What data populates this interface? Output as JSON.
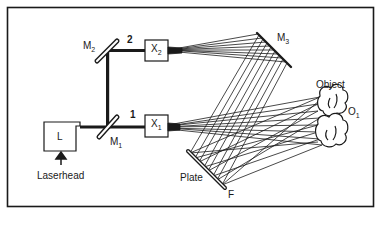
{
  "diagram": {
    "type": "holographic interferometry optical setup",
    "components": {
      "laserhead": {
        "box_label": "L",
        "caption": "Laserhead"
      },
      "mirror_1": {
        "label": "M",
        "sub": "1"
      },
      "mirror_2": {
        "label": "M",
        "sub": "2"
      },
      "mirror_3": {
        "label": "M",
        "sub": "3"
      },
      "expander_1": {
        "label": "X",
        "sub": "1"
      },
      "expander_2": {
        "label": "X",
        "sub": "2"
      },
      "beam_1": {
        "label": "1"
      },
      "beam_2": {
        "label": "2"
      },
      "plate": {
        "label": "Plate",
        "marker": "F"
      },
      "object": {
        "label": "Object",
        "id_label": "O",
        "id_sub": "1"
      }
    },
    "colors": {
      "line": "#1a1a1a",
      "background": "#ffffff"
    }
  }
}
